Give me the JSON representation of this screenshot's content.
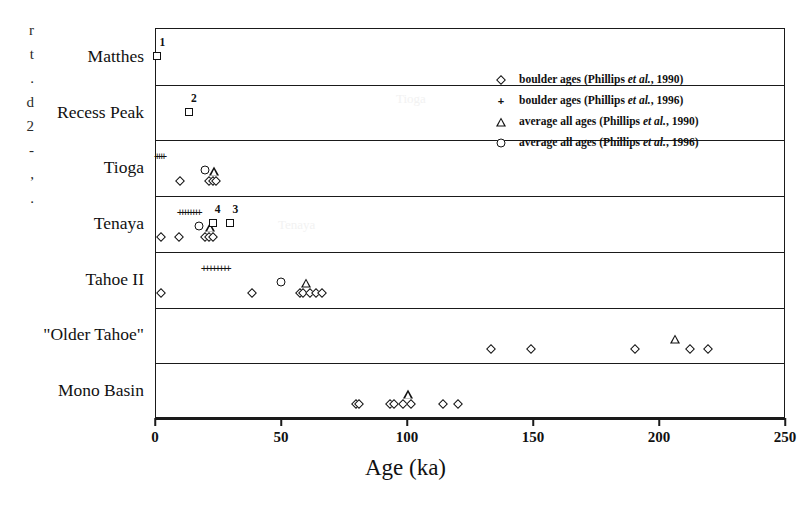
{
  "figure": {
    "caption_fragments": [
      "r",
      "t",
      ".",
      "d",
      "2",
      "-",
      ",",
      "."
    ],
    "watermarks": [
      "Tioga",
      "Tenaya"
    ]
  },
  "legend": {
    "items": [
      {
        "marker": "diamond-icon",
        "text": "boulder ages (Phillips et al., 1990)",
        "pre": "boulder ages (Phillips ",
        "em": "et al.",
        "post": ", 1990)"
      },
      {
        "marker": "plus-icon",
        "text": "boulder ages (Phillips et al., 1996)",
        "pre": "boulder ages (Phillips ",
        "em": "et al.",
        "post": ", 1996)"
      },
      {
        "marker": "triangle-icon",
        "text": "average all ages (Phillips et al., 1990)",
        "pre": "average all ages (Phillips ",
        "em": "et al.",
        "post": ", 1990)"
      },
      {
        "marker": "circle-icon",
        "text": "average all ages (Phillips et al., 1996)",
        "pre": "average all ages (Phillips ",
        "em": "et al.",
        "post": ", 1996)"
      }
    ]
  },
  "chart_data": {
    "type": "scatter",
    "title": "",
    "xlabel": "Age (ka)",
    "ylabel": "",
    "xlim": [
      0,
      250
    ],
    "xticks": [
      0,
      50,
      100,
      150,
      200,
      250
    ],
    "xticklabels": [
      "0",
      "50",
      "100",
      "150",
      "200",
      "250"
    ],
    "grid": false,
    "legend_position": "upper-right-inside",
    "categories": [
      "Matthes",
      "Recess Peak",
      "Tioga",
      "Tenaya",
      "Tahoe II",
      "\"Older Tahoe\"",
      "Mono Basin"
    ],
    "series": [
      {
        "name": "boulder ages (Phillips et al., 1990)",
        "marker": "diamond",
        "points": [
          {
            "category": "Tioga",
            "values": [
              9.5,
              21.0,
              22.5,
              24.0
            ]
          },
          {
            "category": "Tenaya",
            "values": [
              2.0,
              9.0,
              19.5,
              21.0,
              22.5
            ]
          },
          {
            "category": "Tahoe II",
            "values": [
              2.0,
              38.0,
              57.0,
              58.5,
              61.0,
              63.5,
              66.0
            ]
          },
          {
            "category": "\"Older Tahoe\"",
            "values": [
              133.0,
              149.0,
              190.0,
              212.0,
              219.0
            ]
          },
          {
            "category": "Mono Basin",
            "values": [
              79.5,
              80.5,
              93.0,
              94.5,
              98.0,
              101.0,
              114.0,
              120.0
            ]
          }
        ]
      },
      {
        "name": "boulder ages (Phillips et al., 1996)",
        "marker": "plus",
        "points": [
          {
            "category": "Tioga",
            "values": [
              0.5,
              1.4,
              2.3,
              3.2
            ]
          },
          {
            "category": "Tenaya",
            "values": [
              9.5,
              10.6,
              11.7,
              12.8,
              13.9,
              15.0,
              16.1,
              17.2
            ]
          },
          {
            "category": "Tahoe II",
            "values": [
              19.0,
              20.4,
              21.8,
              23.2,
              24.6,
              26.0,
              27.4,
              28.8
            ]
          }
        ]
      },
      {
        "name": "average all ages (Phillips et al., 1990)",
        "marker": "triangle",
        "points": [
          {
            "category": "Tioga",
            "values": [
              23.0
            ]
          },
          {
            "category": "Tenaya",
            "values": [
              21.5
            ]
          },
          {
            "category": "Tahoe II",
            "values": [
              59.5
            ]
          },
          {
            "category": "\"Older Tahoe\"",
            "values": [
              206.0
            ]
          },
          {
            "category": "Mono Basin",
            "values": [
              100.0
            ]
          }
        ]
      },
      {
        "name": "average all ages (Phillips et al., 1996)",
        "marker": "circle",
        "points": [
          {
            "category": "Tioga",
            "values": [
              19.5
            ]
          },
          {
            "category": "Tenaya",
            "values": [
              17.0
            ]
          },
          {
            "category": "Tahoe II",
            "values": [
              49.5
            ]
          }
        ]
      },
      {
        "name": "annotated ages",
        "marker": "square",
        "points": [
          {
            "category": "Matthes",
            "values": [
              0.5
            ],
            "labels": [
              "1"
            ]
          },
          {
            "category": "Recess Peak",
            "values": [
              13.0
            ],
            "labels": [
              "2"
            ]
          },
          {
            "category": "Tenaya",
            "values": [
              22.5,
              29.5
            ],
            "labels": [
              "4",
              "3"
            ]
          }
        ]
      }
    ]
  }
}
